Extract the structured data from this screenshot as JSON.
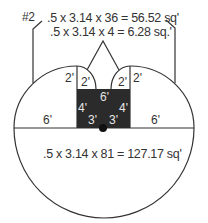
{
  "figure_label": "#2",
  "formulas": {
    "top_outer": ".5 x 3.14 x 36 = 56.52 sq'",
    "top_inner": ".5 x 3.14 x 4 = 6.28 sq.'",
    "bottom": ".5 x 3.14 x 81 = 127.17 sq'"
  },
  "dimensions": {
    "left_radius": "6'",
    "right_radius": "6'",
    "left_outer_small": "2'",
    "left_inner_small": "2'",
    "right_inner_small": "2'",
    "right_outer_small": "2'",
    "rect_width": "6'",
    "rect_left_height": "4'",
    "rect_right_height": "4'",
    "rect_left_half": "3'",
    "rect_right_half": "3'"
  },
  "colors": {
    "line": "#333333",
    "fill_dark": "#2b2b2b",
    "text": "#333333",
    "text_on_dark": "#e6e6e6"
  }
}
